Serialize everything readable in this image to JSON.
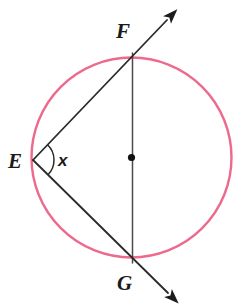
{
  "figure": {
    "kind": "inscribed-angle-circle-diagram",
    "background_color": "#ffffff",
    "width": 249,
    "height": 304
  },
  "circle": {
    "name": "circle",
    "center_x": 131.5,
    "center_y": 157.5,
    "radius": 100,
    "stroke_color": "#ED6A8C",
    "stroke_width": 2.4,
    "fill": "none"
  },
  "center_point": {
    "label": "",
    "x": 131.5,
    "y": 157.5,
    "radius": 3.6,
    "color": "#111111"
  },
  "points": [
    {
      "id": "E",
      "label": "E",
      "x": 33,
      "y": 160,
      "label_x": 8,
      "label_y": 168
    },
    {
      "id": "F",
      "label": "F",
      "x": 133,
      "y": 53,
      "label_x": 116,
      "label_y": 38
    },
    {
      "id": "G",
      "label": "G",
      "x": 133,
      "y": 263,
      "label_x": 117,
      "label_y": 290
    }
  ],
  "segments": [
    {
      "name": "chord-FG-diameter",
      "from": "F",
      "to": "G",
      "x1": 132.5,
      "y1": 53,
      "x2": 132.5,
      "y2": 263,
      "stroke_color": "#4a4a4a",
      "stroke_width": 1.5,
      "arrow": "none"
    }
  ],
  "rays": [
    {
      "name": "ray-E-through-F",
      "from": "E",
      "through": "F",
      "x1": 33,
      "y1": 160,
      "x2": 167,
      "y2": 20,
      "stroke_color": "#2a2a2a",
      "stroke_width": 1.8,
      "arrow": "end"
    },
    {
      "name": "ray-E-through-G",
      "from": "E",
      "through": "G",
      "x1": 33,
      "y1": 160,
      "x2": 168,
      "y2": 293,
      "stroke_color": "#2a2a2a",
      "stroke_width": 1.8,
      "arrow": "end"
    }
  ],
  "angle": {
    "name": "angle-at-E",
    "label": "x",
    "vertex": "E",
    "vertex_x": 33,
    "vertex_y": 160,
    "arc_radius": 21,
    "arc_stroke_color": "#2a2a2a",
    "arc_stroke_width": 1.5,
    "label_x": 58,
    "label_y": 166
  },
  "arrowhead": {
    "color": "#1c1c1c",
    "length": 15,
    "half_width": 5.5
  }
}
